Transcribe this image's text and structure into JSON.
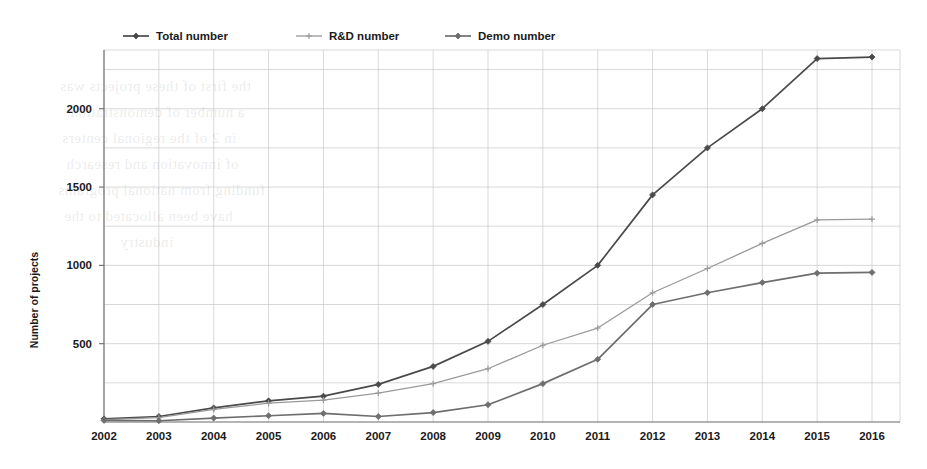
{
  "chart_data": {
    "type": "line",
    "title": "",
    "xlabel": "",
    "ylabel": "Number of projects",
    "categories": [
      "2002",
      "2003",
      "2004",
      "2005",
      "2006",
      "2007",
      "2008",
      "2009",
      "2010",
      "2011",
      "2012",
      "2013",
      "2014",
      "2015",
      "2016"
    ],
    "xticklabels": [
      "2002",
      "2003",
      "2004",
      "2005",
      "2006",
      "2007",
      "2008",
      "2009",
      "2010",
      "2011",
      "2012",
      "2013",
      "2014",
      "2015",
      "2016"
    ],
    "yticklabels": [
      "500",
      "1000",
      "1500",
      "2000"
    ],
    "yticks": [
      500,
      1000,
      1500,
      2000
    ],
    "ylim": [
      0,
      2375
    ],
    "xlim_pad": 0.5,
    "grid": "both-250-and-yearly",
    "legend_position": "top-left-above-axes",
    "series": [
      {
        "name": "Total number",
        "color": "#4a4a4a",
        "marker": "diamond",
        "values": [
          20,
          35,
          90,
          135,
          165,
          240,
          355,
          515,
          750,
          1000,
          1450,
          1750,
          2000,
          2320,
          2330
        ]
      },
      {
        "name": "R&D number",
        "color": "#9a9a9a",
        "marker": "plus",
        "values": [
          15,
          28,
          80,
          120,
          140,
          185,
          245,
          340,
          490,
          600,
          825,
          980,
          1140,
          1290,
          1295
        ]
      },
      {
        "name": "Demo number",
        "color": "#6e6e6e",
        "marker": "diamond",
        "values": [
          10,
          8,
          25,
          40,
          55,
          35,
          60,
          110,
          245,
          400,
          750,
          825,
          890,
          950,
          955
        ]
      }
    ]
  },
  "legend": {
    "items": [
      {
        "label": "Total number"
      },
      {
        "label": "R&D number"
      },
      {
        "label": "Demo number"
      }
    ]
  },
  "axes": {
    "y_title": "Number of projects"
  },
  "background_bleed": {
    "note": "faint reverse-side printing visible through paper",
    "lines": [
      "the first of these projects was",
      "a number of demonstration",
      "in 2 of the regional centers",
      "of innovation and research",
      "funding from national programs",
      "have been allocated to the",
      "industry"
    ]
  }
}
